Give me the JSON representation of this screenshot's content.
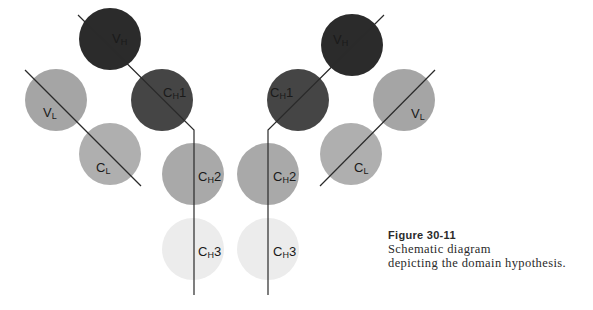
{
  "figure": {
    "title": "Figure 30-11",
    "caption_lines": [
      "Schematic diagram",
      "depicting the domain hypothesis."
    ]
  },
  "colors": {
    "vh": "#2b2b2b",
    "ch1": "#454545",
    "vl": "#a5a5a5",
    "cl": "#afafaf",
    "ch2": "#a9a9a9",
    "ch3": "#ececec",
    "chain_line": "#2a2a2a"
  },
  "domains": {
    "left": {
      "vh": {
        "main": "V",
        "sub": "H"
      },
      "ch1": {
        "main": "C",
        "sub": "H",
        "suffix": "1"
      },
      "vl": {
        "main": "V",
        "sub": "L"
      },
      "cl": {
        "main": "C",
        "sub": "L"
      },
      "ch2": {
        "main": "C",
        "sub": "H",
        "suffix": "2"
      },
      "ch3": {
        "main": "C",
        "sub": "H",
        "suffix": "3"
      }
    },
    "right": {
      "vh": {
        "main": "V",
        "sub": "H"
      },
      "ch1": {
        "main": "C",
        "sub": "H",
        "suffix": "1"
      },
      "vl": {
        "main": "V",
        "sub": "L"
      },
      "cl": {
        "main": "C",
        "sub": "L"
      },
      "ch2": {
        "main": "C",
        "sub": "H",
        "suffix": "2"
      },
      "ch3": {
        "main": "C",
        "sub": "H",
        "suffix": "3"
      }
    }
  }
}
